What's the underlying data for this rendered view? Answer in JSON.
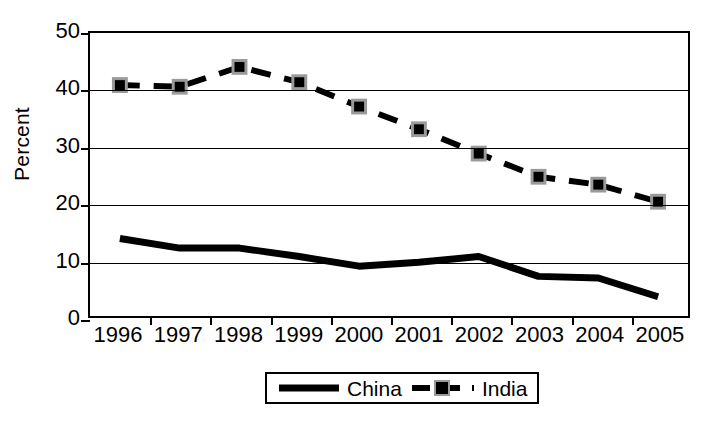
{
  "chart_data": {
    "type": "line",
    "title": "",
    "xlabel": "",
    "ylabel": "Percent",
    "categories": [
      "1996",
      "1997",
      "1998",
      "1999",
      "2000",
      "2001",
      "2002",
      "2003",
      "2004",
      "2005"
    ],
    "ylim": [
      0,
      50
    ],
    "y_ticks": [
      0,
      10,
      20,
      30,
      40,
      50
    ],
    "grid": true,
    "legend_position": "bottom-center",
    "series": [
      {
        "name": "China",
        "style": "solid-thick",
        "marker": "none",
        "color": "#000000",
        "values": [
          13.7,
          12.0,
          12.0,
          10.5,
          8.8,
          9.5,
          10.5,
          7.0,
          6.7,
          3.4
        ]
      },
      {
        "name": "India",
        "style": "dashed",
        "marker": "square",
        "color": "#000000",
        "values": [
          40.8,
          40.5,
          44.0,
          41.3,
          37.0,
          33.0,
          28.7,
          24.6,
          23.2,
          20.2
        ]
      }
    ]
  },
  "legend": {
    "china_label": "China",
    "india_label": "India"
  },
  "axis": {
    "y_title": "Percent"
  }
}
